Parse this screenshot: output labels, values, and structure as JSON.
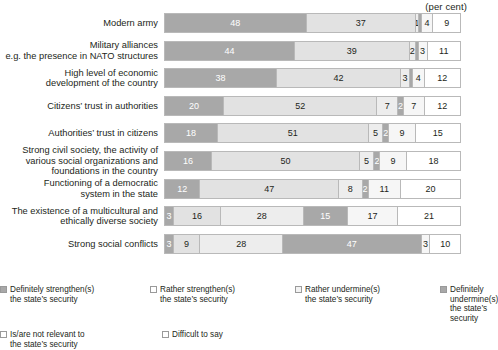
{
  "header": {
    "unit_caption": "(per cent)"
  },
  "chart_data": {
    "type": "bar",
    "orientation": "horizontal",
    "stacked": true,
    "title": "",
    "xlabel": "(per cent)",
    "ylabel": "",
    "xlim": [
      0,
      100
    ],
    "grid": false,
    "legend_position": "bottom",
    "categories": [
      "Modern army",
      "Military alliances\ne.g. the presence in NATO structures",
      "High level of economic\ndevelopment of the country",
      "Citizens' trust in authorities",
      "Authorities' trust in citizens",
      "Strong civil society, the activity of\nvarious social organizations and\nfoundations in the country",
      "Functioning of a democratic\nsystem in the state",
      "The existence of a multicultural and\nethically diverse society",
      "Strong social conflicts"
    ],
    "series": [
      {
        "name": "Definitely strengthen(s) the state's security",
        "color": "#a8a8a8",
        "values": [
          48,
          44,
          38,
          20,
          18,
          16,
          12,
          3,
          3
        ]
      },
      {
        "name": "Rather strengthen(s) the state's security",
        "color": "#e2e2e2",
        "values": [
          37,
          39,
          42,
          52,
          51,
          50,
          47,
          16,
          9
        ]
      },
      {
        "name": "Rather undermine(s) the state's security",
        "color": "#ededed",
        "values": [
          1,
          2,
          3,
          7,
          5,
          5,
          8,
          28,
          28
        ]
      },
      {
        "name": "Definitely undermine(s) the state's security",
        "color": "#a8a8a8",
        "values": [
          1,
          1,
          1,
          2,
          2,
          2,
          2,
          15,
          47
        ]
      },
      {
        "name": "Is/are not relevant to the state's security",
        "color": "#f6f6f6",
        "values": [
          4,
          3,
          4,
          7,
          9,
          9,
          11,
          17,
          3
        ]
      },
      {
        "name": "Difficult to say",
        "color": "#ffffff",
        "values": [
          9,
          11,
          12,
          12,
          15,
          18,
          20,
          21,
          10
        ]
      }
    ],
    "bars": [
      {
        "label": "Modern army",
        "label_lines": [
          "Modern army"
        ],
        "segments": [
          {
            "key": "definitely-strengthens",
            "value": 48,
            "display": "48",
            "style": "s0"
          },
          {
            "key": "rather-strengthens",
            "value": 37,
            "display": "37",
            "style": "s1"
          },
          {
            "key": "rather-undermines",
            "value": 1,
            "display": "1",
            "style": "s2"
          },
          {
            "key": "definitely-undermines",
            "value": 1,
            "display": "",
            "style": "s3"
          },
          {
            "key": "not-relevant",
            "value": 4,
            "display": "4",
            "style": "s4"
          },
          {
            "key": "difficult-to-say",
            "value": 9,
            "display": "9",
            "style": "s5"
          }
        ]
      },
      {
        "label": "Military alliances e.g. the presence in NATO structures",
        "label_lines": [
          "Military alliances",
          "e.g. the presence in NATO structures"
        ],
        "segments": [
          {
            "key": "definitely-strengthens",
            "value": 44,
            "display": "44",
            "style": "s0"
          },
          {
            "key": "rather-strengthens",
            "value": 39,
            "display": "39",
            "style": "s1"
          },
          {
            "key": "rather-undermines",
            "value": 2,
            "display": "2",
            "style": "s2"
          },
          {
            "key": "definitely-undermines",
            "value": 1,
            "display": "",
            "style": "s3"
          },
          {
            "key": "not-relevant",
            "value": 3,
            "display": "3",
            "style": "s4"
          },
          {
            "key": "difficult-to-say",
            "value": 11,
            "display": "11",
            "style": "s5"
          }
        ]
      },
      {
        "label": "High level of economic development of the country",
        "label_lines": [
          "High level of economic",
          "development of the country"
        ],
        "segments": [
          {
            "key": "definitely-strengthens",
            "value": 38,
            "display": "38",
            "style": "s0"
          },
          {
            "key": "rather-strengthens",
            "value": 42,
            "display": "42",
            "style": "s1"
          },
          {
            "key": "rather-undermines",
            "value": 3,
            "display": "3",
            "style": "s2"
          },
          {
            "key": "definitely-undermines",
            "value": 1,
            "display": "",
            "style": "s3"
          },
          {
            "key": "not-relevant",
            "value": 4,
            "display": "4",
            "style": "s4"
          },
          {
            "key": "difficult-to-say",
            "value": 12,
            "display": "12",
            "style": "s5"
          }
        ]
      },
      {
        "label": "Citizens' trust in authorities",
        "label_lines": [
          "Citizens’ trust in authorities"
        ],
        "segments": [
          {
            "key": "definitely-strengthens",
            "value": 20,
            "display": "20",
            "style": "s0"
          },
          {
            "key": "rather-strengthens",
            "value": 52,
            "display": "52",
            "style": "s1"
          },
          {
            "key": "rather-undermines",
            "value": 7,
            "display": "7",
            "style": "s2"
          },
          {
            "key": "definitely-undermines",
            "value": 2,
            "display": "2",
            "style": "s3"
          },
          {
            "key": "not-relevant",
            "value": 7,
            "display": "7",
            "style": "s4"
          },
          {
            "key": "difficult-to-say",
            "value": 12,
            "display": "12",
            "style": "s5"
          }
        ]
      },
      {
        "label": "Authorities' trust in citizens",
        "label_lines": [
          "Authorities’ trust in citizens"
        ],
        "segments": [
          {
            "key": "definitely-strengthens",
            "value": 18,
            "display": "18",
            "style": "s0"
          },
          {
            "key": "rather-strengthens",
            "value": 51,
            "display": "51",
            "style": "s1"
          },
          {
            "key": "rather-undermines",
            "value": 5,
            "display": "5",
            "style": "s2"
          },
          {
            "key": "definitely-undermines",
            "value": 2,
            "display": "2",
            "style": "s3"
          },
          {
            "key": "not-relevant",
            "value": 9,
            "display": "9",
            "style": "s4"
          },
          {
            "key": "difficult-to-say",
            "value": 15,
            "display": "15",
            "style": "s5"
          }
        ]
      },
      {
        "label": "Strong civil society, the activity of various social organizations and foundations in the country",
        "label_lines": [
          "Strong civil society, the activity of",
          "various social organizations and",
          "foundations in the country"
        ],
        "segments": [
          {
            "key": "definitely-strengthens",
            "value": 16,
            "display": "16",
            "style": "s0"
          },
          {
            "key": "rather-strengthens",
            "value": 50,
            "display": "50",
            "style": "s1"
          },
          {
            "key": "rather-undermines",
            "value": 5,
            "display": "5",
            "style": "s2"
          },
          {
            "key": "definitely-undermines",
            "value": 2,
            "display": "2",
            "style": "s3"
          },
          {
            "key": "not-relevant",
            "value": 9,
            "display": "9",
            "style": "s4"
          },
          {
            "key": "difficult-to-say",
            "value": 18,
            "display": "18",
            "style": "s5"
          }
        ]
      },
      {
        "label": "Functioning of a democratic system in the state",
        "label_lines": [
          "Functioning of a democratic",
          "system in the state"
        ],
        "segments": [
          {
            "key": "definitely-strengthens",
            "value": 12,
            "display": "12",
            "style": "s0"
          },
          {
            "key": "rather-strengthens",
            "value": 47,
            "display": "47",
            "style": "s1"
          },
          {
            "key": "rather-undermines",
            "value": 8,
            "display": "8",
            "style": "s2"
          },
          {
            "key": "definitely-undermines",
            "value": 2,
            "display": "2",
            "style": "s3"
          },
          {
            "key": "not-relevant",
            "value": 11,
            "display": "11",
            "style": "s4"
          },
          {
            "key": "difficult-to-say",
            "value": 20,
            "display": "20",
            "style": "s5"
          }
        ]
      },
      {
        "label": "The existence of a multicultural and ethically diverse society",
        "label_lines": [
          "The existence of a multicultural and",
          "ethically diverse society"
        ],
        "segments": [
          {
            "key": "definitely-strengthens",
            "value": 3,
            "display": "3",
            "style": "s0"
          },
          {
            "key": "rather-strengthens",
            "value": 16,
            "display": "16",
            "style": "s1"
          },
          {
            "key": "rather-undermines",
            "value": 28,
            "display": "28",
            "style": "s2"
          },
          {
            "key": "definitely-undermines",
            "value": 15,
            "display": "15",
            "style": "s3"
          },
          {
            "key": "not-relevant",
            "value": 17,
            "display": "17",
            "style": "s4"
          },
          {
            "key": "difficult-to-say",
            "value": 21,
            "display": "21",
            "style": "s5"
          }
        ]
      },
      {
        "label": "Strong social conflicts",
        "label_lines": [
          "Strong social conflicts"
        ],
        "segments": [
          {
            "key": "definitely-strengthens",
            "value": 3,
            "display": "3",
            "style": "s0"
          },
          {
            "key": "rather-strengthens",
            "value": 9,
            "display": "9",
            "style": "s1"
          },
          {
            "key": "rather-undermines",
            "value": 28,
            "display": "28",
            "style": "s2"
          },
          {
            "key": "definitely-undermines",
            "value": 47,
            "display": "47",
            "style": "s3"
          },
          {
            "key": "not-relevant",
            "value": 3,
            "display": "3",
            "style": "s4"
          },
          {
            "key": "difficult-to-say",
            "value": 10,
            "display": "10",
            "style": "s5"
          }
        ]
      }
    ]
  },
  "legend": {
    "items": [
      {
        "key": "definitely-strengthens",
        "swatch": "sw-dark",
        "line1": "Definitely strengthen(s)",
        "line2": "the state’s security"
      },
      {
        "key": "rather-strengthens",
        "swatch": "sw-white",
        "line1": "Rather strengthen(s)",
        "line2": "the state’s security"
      },
      {
        "key": "rather-undermines",
        "swatch": "sw-light",
        "line1": "Rather undermine(s)",
        "line2": "the state’s security"
      },
      {
        "key": "definitely-undermines",
        "swatch": "sw-dark",
        "line1": "Definitely undermine(s)",
        "line2": "the state’s security"
      },
      {
        "key": "not-relevant",
        "swatch": "sw-white",
        "line1": "Is/are not relevant to",
        "line2": "the state’s security"
      },
      {
        "key": "difficult-to-say",
        "swatch": "sw-white",
        "line1": "Difficult to say",
        "line2": ""
      }
    ]
  }
}
